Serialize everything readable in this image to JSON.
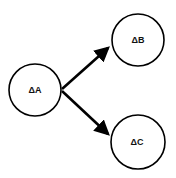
{
  "diagram": {
    "nodes": [
      {
        "id": "A",
        "label": "ΔA",
        "cx": 35,
        "cy": 90,
        "r": 26
      },
      {
        "id": "B",
        "label": "ΔB",
        "cx": 138,
        "cy": 40,
        "r": 26
      },
      {
        "id": "C",
        "label": "ΔC",
        "cx": 138,
        "cy": 142,
        "r": 27
      }
    ],
    "edges": [
      {
        "from": "A",
        "to": "B"
      },
      {
        "from": "A",
        "to": "C"
      }
    ],
    "colors": {
      "stroke": "#000000",
      "background": "#ffffff"
    }
  }
}
